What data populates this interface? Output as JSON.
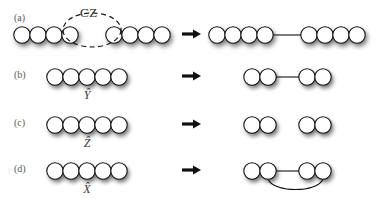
{
  "figure": {
    "type": "quantum-circuit-graph-state-diagram",
    "width": 382,
    "height": 199,
    "background_color": "#ffffff",
    "node_fill": "#ffffff",
    "node_stroke": "#111111",
    "edge_color": "#111111",
    "shadow_color": "#b9b9b9",
    "arrow_glyph": "right-arrow"
  },
  "annotations": {
    "cz_gate_label": "CZ",
    "cz_gate_ellipse_style": "dashed"
  },
  "rows": [
    {
      "id": "a",
      "label": "(a)",
      "operation": "CZ",
      "operation_has_hat": false,
      "left": {
        "node_count": 8,
        "groups": [
          {
            "nodes": 4,
            "edges": []
          },
          {
            "nodes": 4,
            "edges": []
          }
        ],
        "description": "two chains of four touching circles separated by a gap"
      },
      "right": {
        "node_count": 8,
        "edges": [
          {
            "from": 4,
            "to": 5,
            "kind": "straight"
          }
        ],
        "description": "two chains of four circles joined by a straight edge"
      }
    },
    {
      "id": "b",
      "label": "(b)",
      "operation": "Y",
      "operation_has_hat": true,
      "operation_display": "Ŷ",
      "left": {
        "node_count": 5,
        "edges": [],
        "description": "chain of five touching circles"
      },
      "right": {
        "node_count": 4,
        "edges": [
          {
            "from": 2,
            "to": 3,
            "kind": "straight"
          }
        ],
        "description": "two touching pairs joined by a straight edge"
      }
    },
    {
      "id": "c",
      "label": "(c)",
      "operation": "Z",
      "operation_has_hat": true,
      "operation_display": "Ẑ",
      "left": {
        "node_count": 5,
        "edges": [],
        "description": "chain of five touching circles"
      },
      "right": {
        "node_count": 4,
        "edges": [],
        "description": "two separated touching pairs, no connecting edge"
      }
    },
    {
      "id": "d",
      "label": "(d)",
      "operation": "X",
      "operation_has_hat": true,
      "operation_display": "X̂",
      "left": {
        "node_count": 5,
        "edges": [],
        "description": "chain of five touching circles"
      },
      "right": {
        "node_count": 4,
        "edges": [
          {
            "from": 2,
            "to": 3,
            "kind": "straight"
          },
          {
            "from": 2,
            "to": 4,
            "kind": "arc-below"
          }
        ],
        "description": "two touching pairs joined by a straight edge and a lower arc"
      }
    }
  ]
}
